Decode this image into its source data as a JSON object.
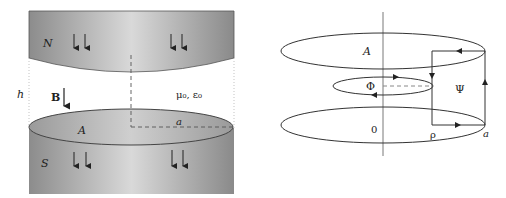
{
  "left_figure": {
    "north_pole_label": "N",
    "south_pole_label": "S",
    "gap_label": "h",
    "field_label": "B",
    "medium_label": "μ₀, ε₀",
    "area_label": "A",
    "radius_label": "a"
  },
  "right_figure": {
    "area_label": "A",
    "inner_loop_label": "Φ",
    "rect_loop_label": "Ψ",
    "origin_label": "0",
    "rho_label": "ρ",
    "radius_label": "a"
  },
  "colors": {
    "magnet_dark": "#8a8a8a",
    "magnet_light": "#d6d6d6",
    "line": "#333333"
  }
}
